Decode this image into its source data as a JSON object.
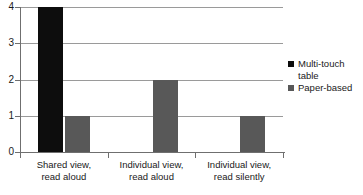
{
  "chart_data": {
    "type": "bar",
    "title": "",
    "subtitle": "",
    "xlabel": "",
    "ylabel": "",
    "ylim": [
      0,
      4
    ],
    "yticks": [
      0,
      1,
      2,
      3,
      4
    ],
    "ytick_labels": [
      "0",
      "1",
      "2",
      "3",
      "4"
    ],
    "grid": true,
    "grid_axis": "y",
    "legend_position": "right",
    "orientation": "vertical",
    "grouped": true,
    "categories": [
      "Shared view,\nread aloud",
      "Individual view,\nread aloud",
      "Individual view,\nread silently"
    ],
    "category_lines": [
      [
        "Shared view,",
        "read aloud"
      ],
      [
        "Individual view,",
        "read aloud"
      ],
      [
        "Individual view,",
        "read silently"
      ]
    ],
    "series": [
      {
        "name": "Multi-touch table",
        "name_lines": [
          "Multi-touch",
          "table"
        ],
        "color": "#0d0d0d",
        "values": [
          4,
          0,
          0
        ]
      },
      {
        "name": "Paper-based",
        "name_lines": [
          "Paper-based"
        ],
        "color": "#585858",
        "values": [
          1,
          2,
          1
        ]
      }
    ],
    "axis_color": "#6f6f6f",
    "gridline_color": "#9a9a9a",
    "background": "#ffffff"
  },
  "caption": {
    "cutoff_text": ""
  }
}
